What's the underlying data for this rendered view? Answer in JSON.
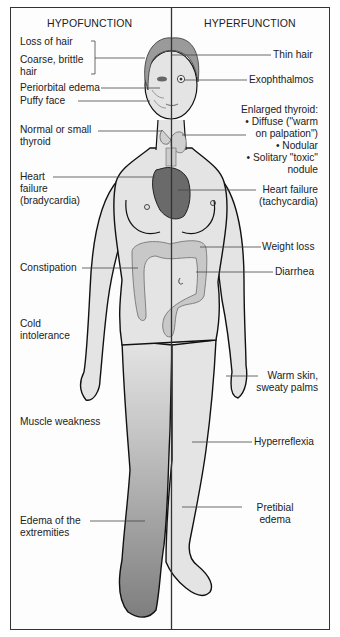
{
  "headings": {
    "left": "HYPOFUNCTION",
    "right": "HYPERFUNCTION"
  },
  "hypofunction_labels": [
    {
      "id": "loss-of-hair",
      "text": "Loss of hair"
    },
    {
      "id": "coarse-hair",
      "line1": "Coarse, brittle",
      "line2": "hair"
    },
    {
      "id": "periorbital-edema",
      "text": "Periorbital edema"
    },
    {
      "id": "puffy-face",
      "text": "Puffy face"
    },
    {
      "id": "small-thyroid",
      "line1": "Normal or small",
      "line2": "thyroid"
    },
    {
      "id": "heart-failure-brady",
      "line1": "Heart",
      "line2": "failure",
      "line3": "(bradycardia)"
    },
    {
      "id": "constipation",
      "text": "Constipation"
    },
    {
      "id": "cold-intolerance",
      "line1": "Cold",
      "line2": "intolerance"
    },
    {
      "id": "muscle-weakness",
      "text": "Muscle weakness"
    },
    {
      "id": "edema-extremities",
      "line1": "Edema of the",
      "line2": "extremities"
    }
  ],
  "hyperfunction_labels": [
    {
      "id": "thin-hair",
      "text": "Thin hair"
    },
    {
      "id": "exophthalmos",
      "text": "Exophthalmos"
    },
    {
      "id": "enlarged-thyroid",
      "lines": [
        "Enlarged thyroid:",
        "• Diffuse (\"warm",
        "on palpation\")",
        "• Nodular",
        "• Solitary \"toxic\"",
        "nodule"
      ]
    },
    {
      "id": "heart-failure-tachy",
      "line1": "Heart failure",
      "line2": "(tachycardia)"
    },
    {
      "id": "weight-loss",
      "text": "Weight loss"
    },
    {
      "id": "diarrhea",
      "text": "Diarrhea"
    },
    {
      "id": "warm-skin",
      "line1": "Warm skin,",
      "line2": "sweaty palms"
    },
    {
      "id": "hyperreflexia",
      "text": "Hyperreflexia"
    },
    {
      "id": "pretibial-edema",
      "line1": "Pretibial",
      "line2": "edema"
    }
  ],
  "colors": {
    "frame": "#333333",
    "skin": "#e4e4e4",
    "outline": "#111111",
    "heart": "#6a6a6a",
    "colon": "#c8c8c8",
    "edema_leg": "#8a8a8a",
    "hair": "#9a9a9a",
    "leader": "#444444"
  }
}
